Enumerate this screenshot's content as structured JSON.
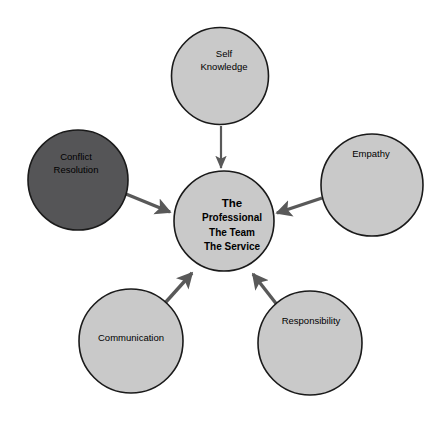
{
  "diagram": {
    "background_color": "#ffffff",
    "colors": {
      "node_fill_light": "#c9c9c9",
      "node_fill_dark": "#555557",
      "node_stroke": "#1a1a1a",
      "arrow_color": "#595959",
      "text_color": "#000000"
    },
    "center": {
      "name": "center-node",
      "cx": 224,
      "cy": 221,
      "r": 50,
      "fill": "#c9c9c9",
      "lines": [
        {
          "text": "The",
          "size": "primary"
        },
        {
          "text": "Professional",
          "size": "secondary"
        },
        {
          "text": "The Team",
          "size": "secondary"
        },
        {
          "text": "The Service",
          "size": "secondary"
        }
      ]
    },
    "nodes": [
      {
        "id": "self-knowledge",
        "label_lines": [
          "Self",
          "Knowledge"
        ],
        "cx": 220,
        "cy": 76,
        "r": 48.5,
        "fill": "#c9c9c9",
        "label_x": 224,
        "label_y": 54
      },
      {
        "id": "conflict-resolution",
        "label_lines": [
          "Conflict",
          "Resolution"
        ],
        "cx": 78,
        "cy": 180,
        "r": 50,
        "fill": "#555557",
        "label_x": 76,
        "label_y": 157
      },
      {
        "id": "empathy",
        "label_lines": [
          "Empathy"
        ],
        "cx": 372,
        "cy": 185,
        "r": 51,
        "fill": "#c9c9c9",
        "label_x": 371,
        "label_y": 154
      },
      {
        "id": "communication",
        "label_lines": [
          "Communication"
        ],
        "cx": 131,
        "cy": 341,
        "r": 52,
        "fill": "#c9c9c9",
        "label_x": 131,
        "label_y": 338
      },
      {
        "id": "responsibility",
        "label_lines": [
          "Responsibility"
        ],
        "cx": 310,
        "cy": 343,
        "r": 52,
        "fill": "#c9c9c9",
        "label_x": 311,
        "label_y": 321
      }
    ],
    "arrows": [
      {
        "id": "self-knowledge-to-center",
        "from": "self-knowledge",
        "to": "center",
        "x1": 221,
        "y1": 126,
        "x2": 221,
        "y2": 168,
        "weight": "thin"
      },
      {
        "id": "conflict-resolution-to-center",
        "from": "conflict-resolution",
        "to": "center",
        "x1": 126,
        "y1": 194,
        "x2": 170,
        "y2": 212,
        "weight": "thick"
      },
      {
        "id": "empathy-to-center",
        "from": "empathy",
        "to": "center",
        "x1": 322,
        "y1": 198,
        "x2": 277,
        "y2": 213,
        "weight": "thick"
      },
      {
        "id": "communication-to-center",
        "from": "communication",
        "to": "center",
        "x1": 165,
        "y1": 303,
        "x2": 192,
        "y2": 273,
        "weight": "thick"
      },
      {
        "id": "responsibility-to-center",
        "from": "responsibility",
        "to": "center",
        "x1": 278,
        "y1": 306,
        "x2": 253,
        "y2": 274,
        "weight": "thick"
      }
    ]
  }
}
